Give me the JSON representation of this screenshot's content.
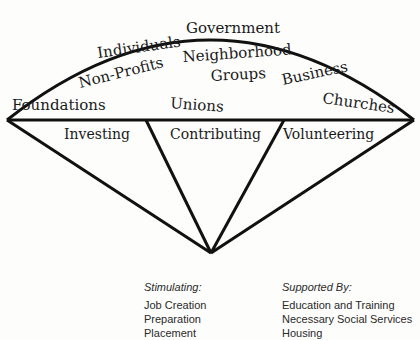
{
  "diagram": {
    "fan_top_labels": [
      {
        "text": "Government",
        "x": 186,
        "y": 33,
        "rotate": 0
      },
      {
        "text": "Individuals",
        "x": 98,
        "y": 58,
        "rotate": -8
      },
      {
        "text": "Neighborhood",
        "x": 183,
        "y": 62,
        "rotate": -4
      },
      {
        "text": "Groups",
        "x": 211,
        "y": 81,
        "rotate": -3
      },
      {
        "text": "Non-Profits",
        "x": 80,
        "y": 88,
        "rotate": -14
      },
      {
        "text": "Business",
        "x": 283,
        "y": 85,
        "rotate": -12
      },
      {
        "text": "Churches",
        "x": 322,
        "y": 103,
        "rotate": 8
      },
      {
        "text": "Foundations",
        "x": 12,
        "y": 110,
        "rotate": 0
      },
      {
        "text": "Unions",
        "x": 170,
        "y": 108,
        "rotate": 4
      }
    ],
    "segment_labels": [
      {
        "text": "Investing",
        "x": 64,
        "y": 139
      },
      {
        "text": "Contributing",
        "x": 170,
        "y": 139
      },
      {
        "text": "Volunteering",
        "x": 283,
        "y": 139
      }
    ]
  },
  "lists": {
    "stimulating": {
      "heading": "Stimulating:",
      "items": [
        "Job Creation",
        "Preparation",
        "Placement"
      ]
    },
    "supported_by": {
      "heading": "Supported By:",
      "items": [
        "Education and Training",
        "Necessary Social Services",
        "Housing"
      ]
    }
  }
}
